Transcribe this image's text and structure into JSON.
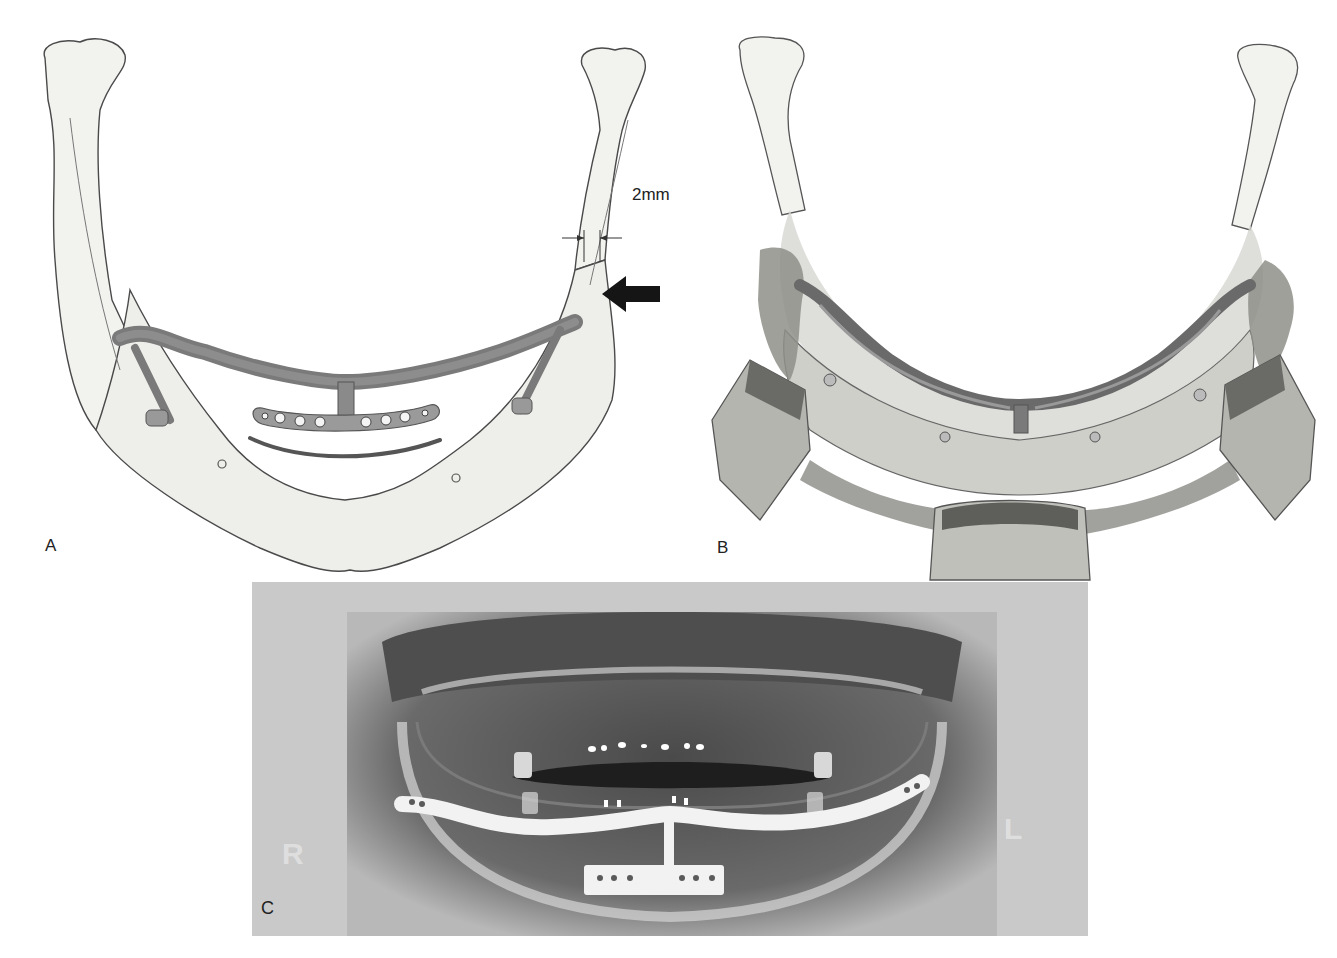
{
  "figure": {
    "panels": [
      {
        "id": "A",
        "label": "A",
        "description": "Mandible illustration with reconstruction bar and T-plate",
        "annotations": {
          "measurement": "2mm",
          "arrow": "arrow-pointing-left"
        }
      },
      {
        "id": "B",
        "label": "B",
        "description": "Surgical exposure with retractors and reconstruction bar"
      },
      {
        "id": "C",
        "label": "C",
        "description": "Panoramic radiograph showing reconstruction plate",
        "markers": {
          "right": "R",
          "left": "L"
        }
      }
    ],
    "colors": {
      "background": "#ffffff",
      "bone_fill": "#f2f2ef",
      "bone_stroke": "#4a4a4a",
      "plate_fill": "#8a8a8a",
      "plate_dark": "#5a5a5a",
      "xray_bg": "#bdbdbd",
      "xray_dark": "#3a3a3a",
      "xray_plate": "#f4f4f4"
    }
  }
}
